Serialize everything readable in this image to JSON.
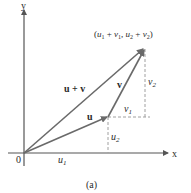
{
  "diagram": {
    "caption": "(a)",
    "axes": {
      "x_label": "x",
      "y_label": "y",
      "origin_label": "0"
    },
    "vectors": {
      "u_label": "u",
      "v_label": "v",
      "sum_label": "u + v"
    },
    "components": {
      "u1": "u",
      "u1_sub": "1",
      "u2": "u",
      "u2_sub": "2",
      "v1": "v",
      "v1_sub": "1",
      "v2": "v",
      "v2_sub": "2"
    },
    "endpoint_label": {
      "open": "(",
      "a": "u",
      "a_sub": "1",
      "plus1": " + ",
      "b": "v",
      "b_sub": "1",
      "comma": ", ",
      "c": "u",
      "c_sub": "2",
      "plus2": " + ",
      "d": "v",
      "d_sub": "2",
      "close": ")"
    },
    "colors": {
      "axis": "#555555",
      "vector": "#6a6a6a",
      "dashed": "#a0a0a0",
      "text": "#2a2a2a"
    }
  }
}
